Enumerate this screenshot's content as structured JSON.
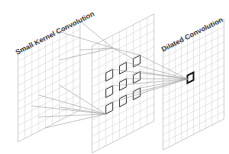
{
  "figure": {
    "title": "",
    "type": "neural-network-convolution-diagram",
    "background_color": "#ffffff"
  },
  "labels": {
    "left": "Small Kernel Convolution",
    "right": "Dilated Convolution"
  },
  "colors": {
    "grid_line": "#c9c9c9",
    "grid_line_faint": "#d8d8d8",
    "plane_edge": "#b5b5b5",
    "connection_line": "#8f8f8f",
    "highlight_cell_stroke": "#555555",
    "output_cell_stroke": "#1a1a1a",
    "label_text": "#3c3c3c",
    "background": "#ffffff"
  },
  "planes": [
    {
      "name": "input-plane",
      "label": "Small Kernel Convolution",
      "grid_cols": 9,
      "grid_rows": 11,
      "highlighted_cells": []
    },
    {
      "name": "intermediate-plane",
      "label": "",
      "grid_cols": 9,
      "grid_rows": 13,
      "highlighted_cells": [
        {
          "col": 1,
          "row": 2
        },
        {
          "col": 3,
          "row": 2
        },
        {
          "col": 5,
          "row": 2
        },
        {
          "col": 1,
          "row": 5
        },
        {
          "col": 3,
          "row": 5
        },
        {
          "col": 5,
          "row": 5
        },
        {
          "col": 1,
          "row": 8
        },
        {
          "col": 3,
          "row": 8
        },
        {
          "col": 5,
          "row": 8
        }
      ],
      "dilation_rate": 2,
      "kernel_size": 3
    },
    {
      "name": "output-plane",
      "label": "Dilated Convolution",
      "grid_cols": 10,
      "grid_rows": 13,
      "highlighted_cells": [
        {
          "col": 4,
          "row": 6
        }
      ]
    }
  ],
  "connections": {
    "small_kernel_fan_count": 6,
    "dilated_fan_count": 9,
    "description": "Lines fan from small-kernel receptive fields on the input plane to single cells on the intermediate plane, and from the nine dilated cells on the intermediate plane to one output cell."
  }
}
